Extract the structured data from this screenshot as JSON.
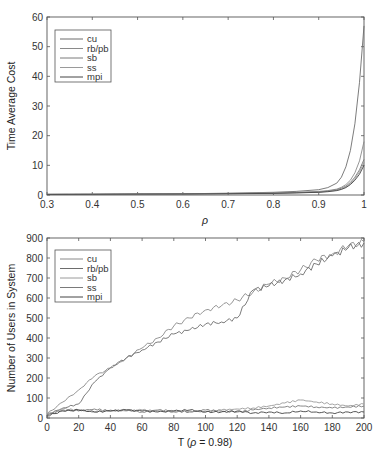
{
  "chart_data": [
    {
      "type": "line",
      "title": "",
      "xlabel": "ρ",
      "ylabel": "Time Average Cost",
      "xlim": [
        0.3,
        1
      ],
      "ylim": [
        0,
        60
      ],
      "xticks": [
        "0.3",
        "0.4",
        "0.5",
        "0.6",
        "0.7",
        "0.8",
        "0.9",
        "1"
      ],
      "yticks": [
        "0",
        "10",
        "20",
        "30",
        "40",
        "50",
        "60"
      ],
      "grid": false,
      "legend_position": "upper-left",
      "x": [
        0.3,
        0.4,
        0.5,
        0.6,
        0.7,
        0.8,
        0.85,
        0.9,
        0.92,
        0.94,
        0.95,
        0.96,
        0.97,
        0.98,
        0.99,
        1.0
      ],
      "series": [
        {
          "name": "cu",
          "color": "#6d6d6d",
          "values": [
            0.2,
            0.25,
            0.3,
            0.4,
            0.6,
            0.9,
            1.2,
            1.8,
            2.5,
            4.0,
            6.0,
            9.5,
            15,
            24,
            38,
            57
          ]
        },
        {
          "name": "rb/pb",
          "color": "#8a8a8a",
          "values": [
            0.2,
            0.25,
            0.3,
            0.35,
            0.5,
            0.7,
            0.9,
            1.2,
            1.5,
            2.0,
            2.6,
            3.5,
            5.0,
            7.5,
            11.5,
            18
          ]
        },
        {
          "name": "sb",
          "color": "#7a7a7a",
          "values": [
            0.2,
            0.25,
            0.3,
            0.35,
            0.45,
            0.6,
            0.8,
            1.0,
            1.3,
            1.8,
            2.3,
            3.0,
            4.2,
            6.0,
            8.5,
            12
          ]
        },
        {
          "name": "ss",
          "color": "#9a9a9a",
          "values": [
            0.2,
            0.25,
            0.3,
            0.35,
            0.45,
            0.6,
            0.75,
            0.95,
            1.2,
            1.6,
            2.0,
            2.7,
            3.8,
            5.5,
            7.8,
            11
          ]
        },
        {
          "name": "mpi",
          "color": "#444444",
          "values": [
            0.2,
            0.25,
            0.3,
            0.35,
            0.45,
            0.55,
            0.7,
            0.9,
            1.1,
            1.5,
            1.9,
            2.5,
            3.5,
            5.0,
            7.0,
            10
          ]
        }
      ]
    },
    {
      "type": "line",
      "title": "",
      "xlabel": "T (ρ = 0.98)",
      "ylabel": "Number of Users in System",
      "xlim": [
        0,
        200
      ],
      "ylim": [
        0,
        900
      ],
      "xticks": [
        "0",
        "20",
        "40",
        "60",
        "80",
        "100",
        "120",
        "140",
        "160",
        "180",
        "200"
      ],
      "yticks": [
        "0",
        "100",
        "200",
        "300",
        "400",
        "500",
        "600",
        "700",
        "800",
        "900"
      ],
      "grid": false,
      "legend_position": "upper-left",
      "x": [
        0,
        10,
        20,
        30,
        40,
        50,
        60,
        70,
        80,
        90,
        100,
        110,
        120,
        130,
        140,
        150,
        160,
        170,
        180,
        190,
        200
      ],
      "series": [
        {
          "name": "cu",
          "color": "#8a8a8a",
          "values": [
            20,
            80,
            140,
            210,
            250,
            300,
            350,
            400,
            460,
            500,
            540,
            560,
            590,
            630,
            670,
            700,
            740,
            790,
            820,
            860,
            880
          ]
        },
        {
          "name": "rb/pb",
          "color": "#6d6d6d",
          "values": [
            15,
            50,
            70,
            180,
            250,
            300,
            340,
            380,
            420,
            440,
            470,
            480,
            500,
            640,
            660,
            690,
            720,
            770,
            810,
            850,
            875
          ]
        },
        {
          "name": "sb",
          "color": "#9a9a9a",
          "values": [
            20,
            45,
            40,
            30,
            40,
            35,
            40,
            35,
            30,
            35,
            30,
            40,
            45,
            50,
            60,
            75,
            90,
            80,
            70,
            60,
            70
          ]
        },
        {
          "name": "ss",
          "color": "#7a7a7a",
          "values": [
            15,
            40,
            35,
            45,
            35,
            40,
            30,
            40,
            35,
            30,
            40,
            35,
            30,
            40,
            50,
            55,
            60,
            55,
            50,
            55,
            60
          ]
        },
        {
          "name": "mpi",
          "color": "#444444",
          "values": [
            10,
            35,
            40,
            30,
            35,
            40,
            35,
            30,
            35,
            40,
            30,
            30,
            35,
            25,
            30,
            25,
            35,
            30,
            25,
            30,
            30
          ]
        }
      ]
    }
  ]
}
